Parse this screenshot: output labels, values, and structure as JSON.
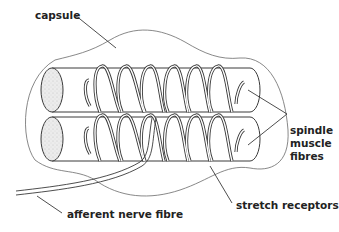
{
  "diagram": {
    "labels": {
      "capsule": "capsule",
      "spindle_line1": "spindle",
      "spindle_line2": "muscle",
      "spindle_line3": "fibres",
      "stretch_receptors": "stretch receptors",
      "afferent_nerve_fibre": "afferent nerve fibre"
    },
    "colors": {
      "stroke": "#3a3a3a",
      "capsule_stroke": "#6a6a6a",
      "fibre_end_fill": "#e6e6e6",
      "background": "#ffffff"
    }
  }
}
